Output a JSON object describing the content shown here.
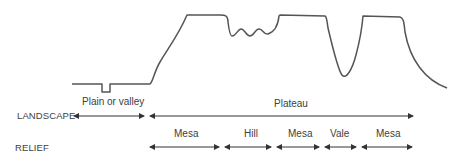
{
  "diagram": {
    "type": "cross-section profile",
    "colors": {
      "line": "#555555",
      "arrow": "#333333",
      "text": "#404040"
    },
    "rows": [
      {
        "id": "landscape",
        "label": "LANDSCAPE",
        "segments": [
          {
            "label": "Plain or valley",
            "x_start": 72,
            "x_end": 146
          },
          {
            "label": "Plateau",
            "x_start": 148,
            "x_end": 415
          }
        ]
      },
      {
        "id": "relief",
        "label": "RELIEF",
        "segments": [
          {
            "label": "Mesa",
            "x_start": 148,
            "x_end": 221
          },
          {
            "label": "Hill",
            "x_start": 223,
            "x_end": 273
          },
          {
            "label": "Mesa",
            "x_start": 275,
            "x_end": 321
          },
          {
            "label": "Vale",
            "x_start": 323,
            "x_end": 358
          },
          {
            "label": "Mesa",
            "x_start": 360,
            "x_end": 414
          }
        ]
      }
    ]
  }
}
